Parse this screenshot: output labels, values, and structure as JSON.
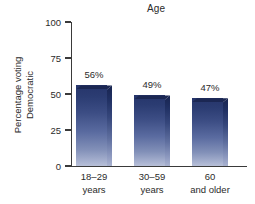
{
  "chart_data": {
    "type": "bar",
    "title": "Age",
    "xlabel": "",
    "ylabel_line1": "Percentage voting",
    "ylabel_line2": "Democratic",
    "categories": [
      "18–29 years",
      "30–59 years",
      "60 and older"
    ],
    "category_lines": [
      [
        "18–29",
        "years"
      ],
      [
        "30–59",
        "years"
      ],
      [
        "60",
        "and older"
      ]
    ],
    "values": [
      56,
      49,
      47
    ],
    "value_labels": [
      "56%",
      "49%",
      "47%"
    ],
    "ylim": [
      0,
      100
    ],
    "yticks": [
      0,
      25,
      50,
      75,
      100
    ],
    "ytick_labels": [
      "0",
      "25",
      "50",
      "75",
      "100"
    ],
    "grid": false,
    "legend": false,
    "colors": {
      "bar_top": "#26356b",
      "bar_bottom": "#b8c0d8",
      "bar_side_top": "#18244f",
      "bar_cap": "#1b2753",
      "axis": "#3a3a3a",
      "text": "#2b2b2b",
      "background": "#ffffff"
    }
  }
}
